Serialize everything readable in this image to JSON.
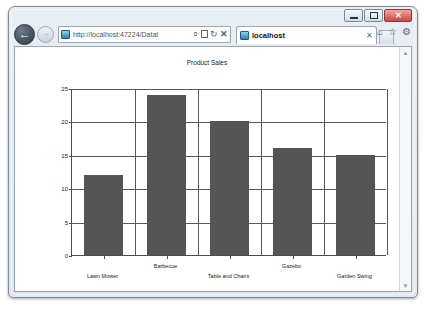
{
  "browser": {
    "window_title": "localhost",
    "caption_buttons": {
      "minimize_label": "–",
      "maximize_label": "□",
      "close_label": "✕"
    },
    "back_label": "←",
    "forward_label": "→",
    "address": {
      "scheme_prefix": "http://",
      "host": "localhost",
      "path": ":47224/Datat",
      "full_text": "http://localhost:47224/Datat"
    },
    "address_icons": {
      "search": "⌕",
      "compatibility": "",
      "refresh": "↻",
      "stop": "✕"
    },
    "tab": {
      "title": "localhost",
      "close_label": "✕"
    },
    "toolbar_icons": {
      "home": "⌂",
      "favorites": "☆",
      "tools": "⚙"
    },
    "scrollbar": {
      "up_arrow": "▲",
      "down_arrow": "▼"
    }
  },
  "chart_data": {
    "type": "bar",
    "title": "Product Sales",
    "xlabel": "",
    "ylabel": "",
    "categories": [
      "Lawn Mower",
      "Barbecue",
      "Table and Chairs",
      "Gazebo",
      "Garden Swing"
    ],
    "values": [
      12,
      24,
      20,
      16,
      15
    ],
    "series": [
      {
        "name": "Product Sales",
        "values": [
          12,
          24,
          20,
          16,
          15
        ],
        "color": "#555555"
      }
    ],
    "ylim": [
      0,
      25
    ],
    "yticks": [
      0,
      5,
      10,
      15,
      20,
      25
    ],
    "ytick_labels": [
      "0",
      "5",
      "10",
      "15",
      "20",
      "25"
    ],
    "grid": true,
    "legend": false,
    "label_stagger": true,
    "axis_color": "#4d4d4d",
    "grid_color": "#585858",
    "background": "#ffffff"
  }
}
